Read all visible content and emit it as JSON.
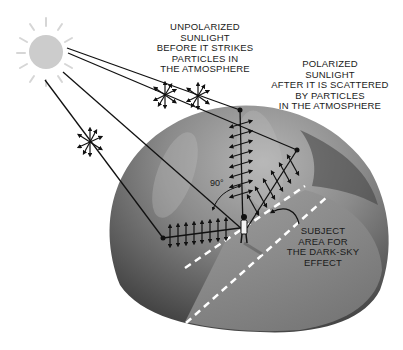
{
  "labels": {
    "unpolarized": [
      "UNPOLARIZED",
      "SUNLIGHT",
      "BEFORE IT STRIKES",
      "PARTICLES IN",
      "THE ATMOSPHERE"
    ],
    "polarized": [
      "POLARIZED",
      "SUNLIGHT",
      "AFTER IT IS SCATTERED",
      "BY PARTICLES",
      "IN THE ATMOSPHERE"
    ],
    "subject_area": [
      "SUBJECT",
      "AREA FOR",
      "THE DARK-SKY",
      "EFFECT"
    ],
    "angle": "90°"
  },
  "icons": {
    "sun": "sun-icon",
    "unpolarized_light": "multi-direction-arrows-icon",
    "polarized_light": "parallel-arrows-icon",
    "observer": "person-icon",
    "rotation_arrow": "curved-arrow-icon"
  },
  "colors": {
    "sun": "#cccccc",
    "sun_rays": "#d4d4d4",
    "dome_light": "#9a9a9a",
    "dome_dark": "#4a4a4a",
    "ground_plane": "#8e8e8e",
    "lines": "#111111",
    "dashes": "#ffffff"
  }
}
